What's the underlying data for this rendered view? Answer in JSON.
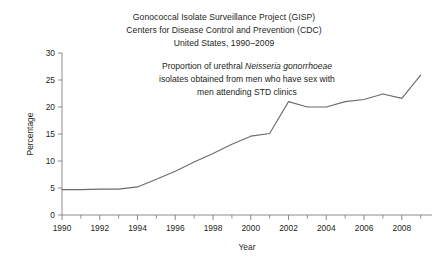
{
  "figure": {
    "background_color": "#ffffff",
    "text_color": "#231f20",
    "line_color": "#6b6b6b",
    "axis_color": "#808080"
  },
  "title": {
    "line1": "Gonococcal Isolate Surveillance Project (GISP)",
    "line2": "Centers for Disease Control and Prevention (CDC)",
    "line3": "United States, 1990–2009"
  },
  "annotation": {
    "line1_pre": "Proportion of urethral ",
    "line1_italic": "Neisseria gonorrhoeae",
    "line2": "isolates obtained from men who have sex with",
    "line3": "men attending STD clinics"
  },
  "axes": {
    "ylabel": "Percentage",
    "xlabel": "Year",
    "yticks": [
      "30",
      "25",
      "20",
      "15",
      "10",
      "5",
      "0"
    ],
    "xticks": [
      "1990",
      "1992",
      "1994",
      "1996",
      "1998",
      "2000",
      "2002",
      "2004",
      "2006",
      "2008"
    ]
  },
  "chart_data": {
    "type": "line",
    "annotation": "Proportion of urethral Neisseria gonorrhoeae isolates obtained from men who have sex with men attending STD clinics",
    "xlabel": "Year",
    "ylabel": "Percentage",
    "xlim": [
      1990,
      2009.6
    ],
    "ylim": [
      0,
      30
    ],
    "ytick_values": [
      0,
      5,
      10,
      15,
      20,
      25,
      30
    ],
    "xtick_values": [
      1990,
      1992,
      1994,
      1996,
      1998,
      2000,
      2002,
      2004,
      2006,
      2008
    ],
    "xtick_minor_step": 1,
    "grid": false,
    "legend": "none",
    "x": [
      1990,
      1991,
      1992,
      1993,
      1994,
      1995,
      1996,
      1997,
      1998,
      1999,
      2000,
      2001,
      2002,
      2003,
      2004,
      2005,
      2006,
      2007,
      2008,
      2009
    ],
    "values": [
      4.7,
      4.7,
      4.8,
      4.8,
      5.2,
      6.6,
      8.1,
      9.8,
      11.4,
      13.1,
      14.6,
      15.1,
      21.0,
      20.0,
      20.0,
      21.0,
      21.4,
      22.4,
      21.6,
      25.9
    ],
    "series": [
      {
        "name": "Percentage of urethral isolates from MSM",
        "values": [
          4.7,
          4.7,
          4.8,
          4.8,
          5.2,
          6.6,
          8.1,
          9.8,
          11.4,
          13.1,
          14.6,
          15.1,
          21.0,
          20.0,
          20.0,
          21.0,
          21.4,
          22.4,
          21.6,
          25.9
        ]
      }
    ]
  }
}
